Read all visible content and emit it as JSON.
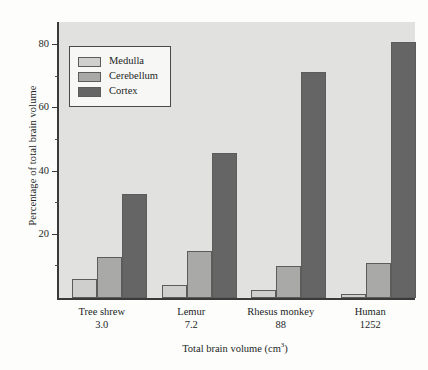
{
  "chart_data": {
    "type": "bar",
    "title": "",
    "xlabel": "Total brain volume (cm3)",
    "xlabel_base": "Total brain volume (cm",
    "xlabel_sup": "3",
    "xlabel_tail": ")",
    "ylabel": "Percentage of total brain volume",
    "categories": [
      "Tree shrew",
      "Lemur",
      "Rhesus monkey",
      "Human"
    ],
    "category_values": [
      "3.0",
      "7.2",
      "88",
      "1252"
    ],
    "series": [
      {
        "name": "Medulla",
        "color": "#cfcfcd",
        "values": [
          6,
          4,
          2.5,
          1.2
        ]
      },
      {
        "name": "Cerebellum",
        "color": "#a9a9a7",
        "values": [
          13,
          15,
          10,
          11
        ]
      },
      {
        "name": "Cortex",
        "color": "#656565",
        "values": [
          33,
          46,
          71.5,
          81
        ]
      }
    ],
    "ylim": [
      0,
      88
    ],
    "yticks_major": [
      20,
      40,
      60,
      80
    ],
    "ytick_labels": [
      "20",
      "40",
      "60",
      "80"
    ],
    "yticks_minor": [
      10,
      30,
      50,
      70
    ],
    "grid": false,
    "legend_position": "upper-left",
    "plot_background": "#e1e1df",
    "axis_color": "#3a3a3a"
  },
  "legend": {
    "items": [
      {
        "label": "Medulla"
      },
      {
        "label": "Cerebellum"
      },
      {
        "label": "Cortex"
      }
    ]
  }
}
